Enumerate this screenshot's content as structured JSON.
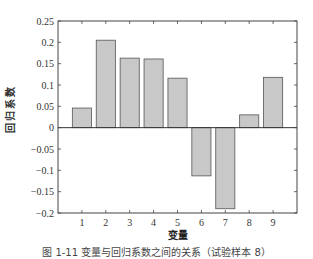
{
  "chart_data": {
    "type": "bar",
    "title": "",
    "xlabel": "变量",
    "ylabel": "回归系数",
    "categories": [
      "1",
      "2",
      "3",
      "4",
      "5",
      "6",
      "7",
      "8",
      "9"
    ],
    "values": [
      0.046,
      0.205,
      0.163,
      0.161,
      0.116,
      -0.113,
      -0.19,
      0.03,
      0.118
    ],
    "ylim": [
      -0.2,
      0.25
    ],
    "xlim": [
      0,
      10
    ],
    "yticks": [
      0.25,
      0.2,
      0.15,
      0.1,
      0.05,
      0,
      -0.05,
      -0.1,
      -0.15,
      -0.2
    ],
    "ytick_labels": [
      "0.25",
      "0.2",
      "0.15",
      "0.1",
      "0.05",
      "0",
      "−0.05",
      "−0.1",
      "−0.15",
      "−0.2"
    ],
    "grid": false,
    "legend": null,
    "bar_color": "#c8c8c8",
    "bar_edge_color": "#555555"
  },
  "caption": "图 1-11  变量与回归系数之间的关系（试验样本 8）"
}
